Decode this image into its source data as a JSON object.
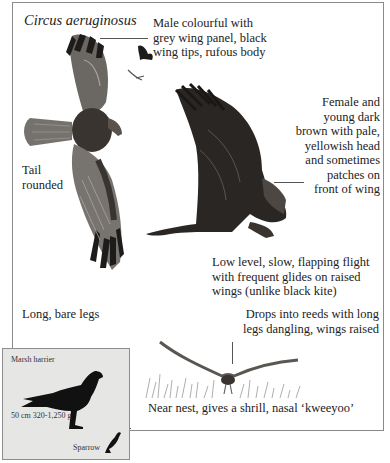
{
  "species": "Circus aeruginosus",
  "annotations": {
    "male": [
      "Male colourful with",
      "grey wing panel, black",
      "wing tips, rufous body"
    ],
    "female": [
      "Female and",
      "young dark",
      "brown with pale,",
      "yellowish head",
      "and sometimes",
      "patches on",
      "front of wing"
    ],
    "tail": [
      "Tail",
      "rounded"
    ],
    "flight": [
      "Low level, slow, flapping flight",
      "with frequent glides on raised",
      "wings (unlike black kite)"
    ],
    "legs": "Long, bare legs",
    "drops": [
      "Drops into reeds with long",
      "legs dangling, wings raised"
    ],
    "call": "Near nest, gives a shrill, nasal ‘kweeyoo’"
  },
  "size_inset": {
    "title": "Marsh harrier",
    "measurements": "50 cm  320-1,250 g",
    "comparison": "Sparrow"
  },
  "colors": {
    "frame": "#8a8a8a",
    "inset_bg": "#e6e6e4",
    "bird_dark": "#2a2624",
    "bird_grey": "#6e6a66",
    "text": "#222222"
  }
}
